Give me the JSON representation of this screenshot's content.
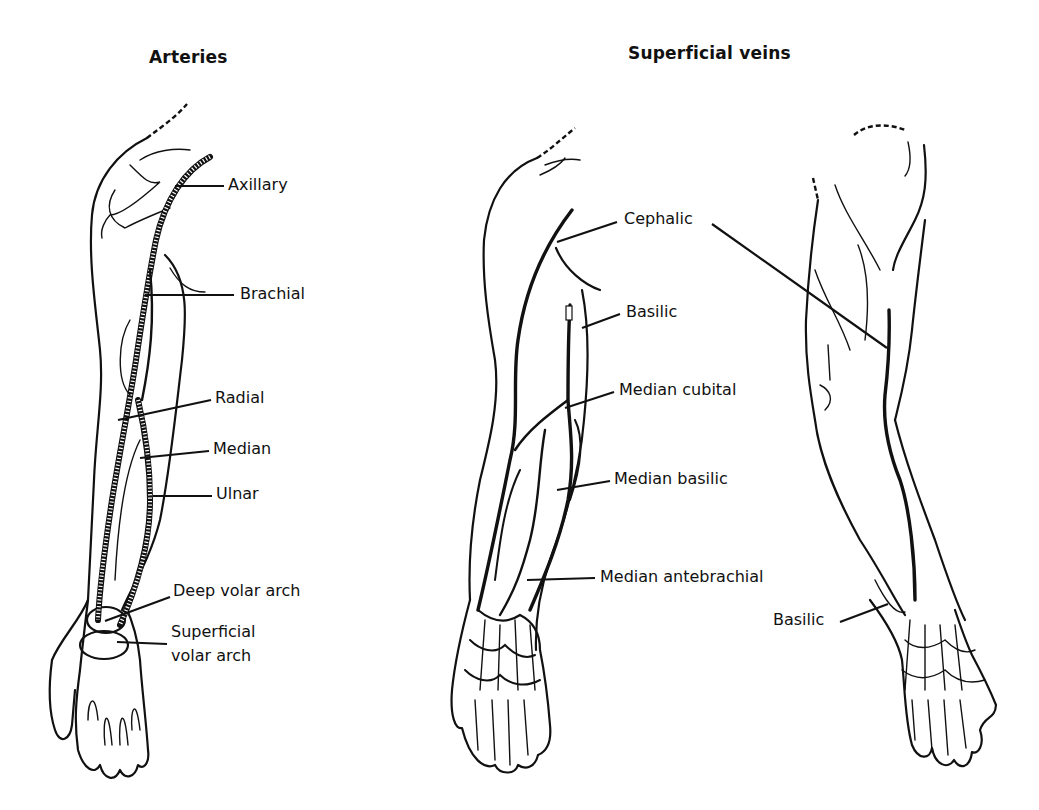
{
  "panels": {
    "arteries": {
      "title": "Arteries",
      "labels": [
        {
          "text": "Axillary",
          "x": 228,
          "y": 176,
          "lx1": 175,
          "ly1": 186,
          "lx2": 224,
          "ly2": 186
        },
        {
          "text": "Brachial",
          "x": 240,
          "y": 285,
          "lx1": 145,
          "ly1": 295,
          "lx2": 234,
          "ly2": 295
        },
        {
          "text": "Radial",
          "x": 215,
          "y": 389,
          "lx1": 118,
          "ly1": 420,
          "lx2": 211,
          "ly2": 400
        },
        {
          "text": "Median",
          "x": 213,
          "y": 440,
          "lx1": 140,
          "ly1": 458,
          "lx2": 209,
          "ly2": 451
        },
        {
          "text": "Ulnar",
          "x": 216,
          "y": 485,
          "lx1": 153,
          "ly1": 496,
          "lx2": 212,
          "ly2": 496
        },
        {
          "text": "Deep volar arch",
          "x": 173,
          "y": 582,
          "lx1": 105,
          "ly1": 621,
          "lx2": 170,
          "ly2": 597
        },
        {
          "text": "Superficial",
          "x": 171,
          "y": 623,
          "lx1": 117,
          "ly1": 642,
          "lx2": 167,
          "ly2": 644
        },
        {
          "text": "volar arch",
          "x": 171,
          "y": 647
        }
      ]
    },
    "superficial_veins": {
      "title": "Superficial veins",
      "labels": [
        {
          "text": "Cephalic",
          "x": 624,
          "y": 210,
          "lx1": 557,
          "ly1": 242,
          "lx2": 617,
          "ly2": 222
        },
        {
          "text": "Basilic",
          "x": 626,
          "y": 303,
          "lx1": 582,
          "ly1": 328,
          "lx2": 620,
          "ly2": 314
        },
        {
          "text": "Median cubital",
          "x": 619,
          "y": 381,
          "lx1": 565,
          "ly1": 408,
          "lx2": 614,
          "ly2": 392
        },
        {
          "text": "Median basilic",
          "x": 614,
          "y": 470,
          "lx1": 557,
          "ly1": 490,
          "lx2": 610,
          "ly2": 481
        },
        {
          "text": "Median antebrachial",
          "x": 600,
          "y": 568,
          "lx1": 527,
          "ly1": 580,
          "lx2": 595,
          "ly2": 578
        },
        {
          "text": "Basilic",
          "x": 773,
          "y": 611,
          "lx1": 840,
          "ly1": 622,
          "lx2": 888,
          "ly2": 604
        }
      ],
      "cephalic_back_leader": {
        "lx1": 712,
        "ly1": 224,
        "lx2": 887,
        "ly2": 348
      }
    }
  }
}
